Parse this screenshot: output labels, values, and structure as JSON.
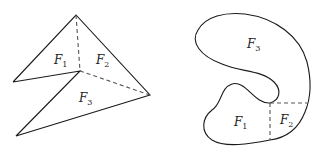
{
  "figures": [
    {
      "name": "polyhedral-surface",
      "labels": [
        {
          "letter": "F",
          "sub": "1"
        },
        {
          "letter": "F",
          "sub": "2"
        },
        {
          "letter": "F",
          "sub": "3"
        }
      ]
    },
    {
      "name": "curved-region",
      "labels": [
        {
          "letter": "F",
          "sub": "3"
        },
        {
          "letter": "F",
          "sub": "1"
        },
        {
          "letter": "F",
          "sub": "2"
        }
      ]
    }
  ],
  "colors": {
    "stroke": "#1a1a1a",
    "dash": "#555555"
  }
}
